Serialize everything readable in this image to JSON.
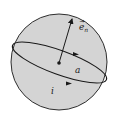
{
  "diagram": {
    "type": "current-loop-in-sphere",
    "labels": {
      "normal_vector": "e",
      "normal_vector_sub": "n",
      "radius": "a",
      "current": "i"
    },
    "colors": {
      "sphere_fill": "#d4d4d4",
      "stroke": "#1a1a1a",
      "background": "#ffffff"
    }
  }
}
